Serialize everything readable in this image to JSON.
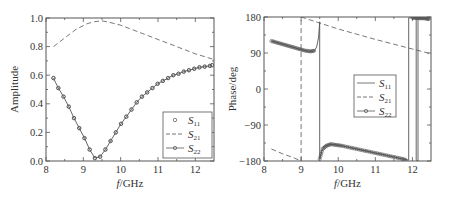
{
  "chart_data": [
    {
      "type": "line",
      "panel": "left",
      "title": "",
      "xlabel": "f/GHz",
      "ylabel": "Amplitude",
      "xlim": [
        8,
        12.5
      ],
      "ylim": [
        0,
        1.0
      ],
      "xticks": [
        8,
        9,
        10,
        11,
        12
      ],
      "xtick_labels": [
        "8",
        "9",
        "10",
        "11",
        "12"
      ],
      "yticks": [
        0,
        0.2,
        0.4,
        0.6,
        0.8,
        1.0
      ],
      "ytick_labels": [
        "0.0",
        "0.2",
        "0.4",
        "0.6",
        "0.8",
        "1.0"
      ],
      "grid": false,
      "legend_position": "lower right",
      "series": [
        {
          "name": "S11",
          "label_main": "S",
          "label_sub": "11",
          "style": "markers-only",
          "x": [
            8.2,
            8.33,
            8.47,
            8.61,
            8.75,
            8.89,
            9.03,
            9.17,
            9.31,
            9.45,
            9.59,
            9.73,
            9.87,
            10.01,
            10.15,
            10.29,
            10.43,
            10.57,
            10.71,
            10.85,
            10.99,
            11.13,
            11.27,
            11.41,
            11.55,
            11.69,
            11.83,
            11.97,
            12.11,
            12.25,
            12.39,
            12.45
          ],
          "y": [
            0.58,
            0.51,
            0.45,
            0.38,
            0.3,
            0.23,
            0.16,
            0.08,
            0.02,
            0.03,
            0.08,
            0.14,
            0.2,
            0.26,
            0.31,
            0.36,
            0.41,
            0.45,
            0.48,
            0.51,
            0.54,
            0.56,
            0.58,
            0.6,
            0.61,
            0.625,
            0.635,
            0.645,
            0.655,
            0.66,
            0.665,
            0.67
          ]
        },
        {
          "name": "S21",
          "label_main": "S",
          "label_sub": "21",
          "style": "dashed",
          "x": [
            8.2,
            8.5,
            8.8,
            9.1,
            9.3,
            9.5,
            9.7,
            10.0,
            10.5,
            11.0,
            11.5,
            12.0,
            12.5
          ],
          "y": [
            0.8,
            0.86,
            0.92,
            0.96,
            0.975,
            0.98,
            0.97,
            0.95,
            0.9,
            0.85,
            0.8,
            0.75,
            0.71
          ]
        },
        {
          "name": "S22",
          "label_main": "S",
          "label_sub": "22",
          "style": "line-markers",
          "x": [
            8.2,
            8.33,
            8.47,
            8.61,
            8.75,
            8.89,
            9.03,
            9.17,
            9.31,
            9.45,
            9.59,
            9.73,
            9.87,
            10.01,
            10.15,
            10.29,
            10.43,
            10.57,
            10.71,
            10.85,
            10.99,
            11.13,
            11.27,
            11.41,
            11.55,
            11.69,
            11.83,
            11.97,
            12.11,
            12.25,
            12.39,
            12.45
          ],
          "y": [
            0.58,
            0.51,
            0.45,
            0.38,
            0.3,
            0.23,
            0.16,
            0.08,
            0.02,
            0.03,
            0.08,
            0.14,
            0.2,
            0.26,
            0.31,
            0.36,
            0.41,
            0.45,
            0.48,
            0.51,
            0.54,
            0.56,
            0.58,
            0.6,
            0.61,
            0.625,
            0.635,
            0.645,
            0.655,
            0.66,
            0.665,
            0.67
          ]
        }
      ]
    },
    {
      "type": "line",
      "panel": "right",
      "title": "",
      "xlabel": "f/GHz",
      "ylabel": "Phase/deg",
      "xlim": [
        8,
        12.5
      ],
      "ylim": [
        -180,
        180
      ],
      "xticks": [
        8,
        9,
        10,
        11,
        12
      ],
      "xtick_labels": [
        "8",
        "9",
        "10",
        "11",
        "12"
      ],
      "yticks": [
        -180,
        -90,
        0,
        90,
        180
      ],
      "ytick_labels": [
        "−180",
        "−90",
        "0",
        "90",
        "180"
      ],
      "grid": false,
      "legend_position": "center right",
      "series": [
        {
          "name": "S11",
          "label_main": "S",
          "label_sub": "11",
          "style": "solid",
          "segments": [
            {
              "x": [
                8.2,
                8.5,
                8.8,
                9.0,
                9.2,
                9.35,
                9.42,
                9.47,
                9.5
              ],
              "y": [
                120,
                112,
                104,
                98,
                94,
                95,
                105,
                130,
                168
              ]
            },
            {
              "x": [
                9.5,
                9.5
              ],
              "y": [
                168,
                -175
              ]
            },
            {
              "x": [
                9.5,
                9.55,
                9.65,
                9.8,
                10.0,
                10.5,
                11.0,
                11.5,
                11.9
              ],
              "y": [
                -175,
                -155,
                -142,
                -138,
                -140,
                -150,
                -160,
                -170,
                -178
              ]
            },
            {
              "x": [
                11.9,
                11.9
              ],
              "y": [
                -178,
                178
              ]
            },
            {
              "x": [
                11.9,
                12.1
              ],
              "y": [
                178,
                178
              ]
            },
            {
              "x": [
                12.1,
                12.1
              ],
              "y": [
                178,
                -178
              ]
            },
            {
              "x": [
                12.1,
                12.15
              ],
              "y": [
                -178,
                -180
              ]
            },
            {
              "x": [
                12.15,
                12.15
              ],
              "y": [
                -180,
                180
              ]
            },
            {
              "x": [
                12.15,
                12.45
              ],
              "y": [
                178,
                175
              ]
            }
          ]
        },
        {
          "name": "S21",
          "label_main": "S",
          "label_sub": "21",
          "style": "dashed",
          "segments": [
            {
              "x": [
                8.2,
                8.5,
                8.8,
                9.0
              ],
              "y": [
                -150,
                -162,
                -172,
                -180
              ]
            },
            {
              "x": [
                9.0,
                9.0
              ],
              "y": [
                -180,
                180
              ]
            },
            {
              "x": [
                9.0,
                9.5,
                10.0,
                10.5,
                11.0,
                11.5,
                12.0,
                12.5
              ],
              "y": [
                180,
                165,
                150,
                137,
                124,
                112,
                100,
                88
              ]
            }
          ]
        },
        {
          "name": "S22",
          "label_main": "S",
          "label_sub": "22",
          "style": "line-markers",
          "segments": [
            {
              "x": [
                8.2,
                8.35,
                8.5,
                8.65,
                8.8,
                8.95,
                9.1,
                9.25,
                9.38
              ],
              "y": [
                120,
                116,
                112,
                108,
                104,
                100,
                96,
                94,
                96
              ]
            },
            {
              "x": [
                9.5,
                9.58,
                9.68,
                9.8,
                9.95,
                10.1,
                10.3,
                10.5,
                10.7,
                10.9,
                11.1,
                11.3,
                11.5,
                11.7,
                11.85
              ],
              "y": [
                -175,
                -150,
                -142,
                -138,
                -140,
                -142,
                -146,
                -150,
                -154,
                -158,
                -162,
                -166,
                -170,
                -174,
                -178
              ]
            },
            {
              "x": [
                12.0,
                12.1,
                12.2,
                12.3,
                12.4,
                12.45
              ],
              "y": [
                178,
                178,
                177,
                177,
                176,
                175
              ]
            }
          ]
        }
      ]
    }
  ]
}
